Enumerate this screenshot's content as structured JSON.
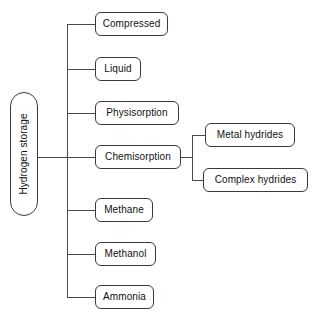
{
  "diagram": {
    "type": "tree",
    "orientation": "left-to-right",
    "colors": {
      "background": "#ffffff",
      "node_fill": "#ffffff",
      "node_border": "#3a3a3a",
      "connector": "#4a4a4a",
      "text": "#111111"
    },
    "root": {
      "id": "hydrogen-storage",
      "label": "Hydrogen storage",
      "rotated": "vertical-bottom-to-top",
      "x": 10,
      "y": 92,
      "w": 28,
      "h": 124
    },
    "branches": [
      {
        "id": "compressed",
        "label": "Compressed",
        "level": 1,
        "x": 95,
        "y": 12,
        "w": 73,
        "h": 24
      },
      {
        "id": "liquid",
        "label": "Liquid",
        "level": 1,
        "x": 95,
        "y": 57,
        "w": 46,
        "h": 24
      },
      {
        "id": "physisorption",
        "label": "Physisorption",
        "level": 1,
        "x": 95,
        "y": 101,
        "w": 84,
        "h": 24
      },
      {
        "id": "chemisorption",
        "label": "Chemisorption",
        "level": 1,
        "x": 95,
        "y": 145,
        "w": 86,
        "h": 24
      },
      {
        "id": "methane",
        "label": "Methane",
        "level": 1,
        "x": 95,
        "y": 198,
        "w": 58,
        "h": 24
      },
      {
        "id": "methanol",
        "label": "Methanol",
        "level": 1,
        "x": 95,
        "y": 242,
        "w": 61,
        "h": 24
      },
      {
        "id": "ammonia",
        "label": "Ammonia",
        "level": 1,
        "x": 95,
        "y": 285,
        "w": 59,
        "h": 24
      },
      {
        "id": "metal-hydrides",
        "label": "Metal hydrides",
        "level": 2,
        "parent": "chemisorption",
        "x": 205,
        "y": 123,
        "w": 90,
        "h": 24
      },
      {
        "id": "complex-hydrides",
        "label": "Complex hydrides",
        "level": 2,
        "parent": "chemisorption",
        "x": 203,
        "y": 168,
        "w": 105,
        "h": 24
      }
    ]
  }
}
